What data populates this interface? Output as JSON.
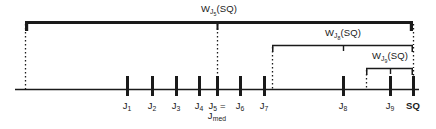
{
  "figure": {
    "background_color": "#ffffff",
    "line_color": "#1a1a1a",
    "axis": {
      "name": "number-line-axis",
      "x_start": 15,
      "x_end": 419,
      "y": 89
    },
    "ticks": [
      {
        "id": "J1",
        "label_main": "J",
        "label_sub": "1",
        "x": 127,
        "label_line2": null
      },
      {
        "id": "J2",
        "label_main": "J",
        "label_sub": "2",
        "x": 152,
        "label_line2": null
      },
      {
        "id": "J3",
        "label_main": "J",
        "label_sub": "3",
        "x": 176,
        "label_line2": null
      },
      {
        "id": "J4",
        "label_main": "J",
        "label_sub": "4",
        "x": 199,
        "label_line2": null
      },
      {
        "id": "J5",
        "label_main": "J",
        "label_sub": "5",
        "x": 217,
        "label_suffix": " =",
        "label_line2": "J",
        "label_line2_sub": "med"
      },
      {
        "id": "J6",
        "label_main": "J",
        "label_sub": "6",
        "x": 240,
        "label_line2": null
      },
      {
        "id": "J7",
        "label_main": "J",
        "label_sub": "7",
        "x": 264,
        "label_line2": null
      },
      {
        "id": "J8",
        "label_main": "J",
        "label_sub": "8",
        "x": 343,
        "label_line2": null
      },
      {
        "id": "J9",
        "label_main": "J",
        "label_sub": "9",
        "x": 390,
        "label_line2": null
      },
      {
        "id": "SQ",
        "label_main": "SQ",
        "label_sub": null,
        "x": 413,
        "label_line2": null,
        "bold": true
      }
    ],
    "brackets": [
      {
        "id": "bracket-J5",
        "label_main": "W",
        "label_sub": "J",
        "label_sub_sub": "5",
        "label_tail": "(SQ)",
        "label_text": "W_J5(SQ)",
        "x_left": 25,
        "x_right": 413,
        "y": 22,
        "tick_x": 217,
        "label_x": 219,
        "label_y": 4
      },
      {
        "id": "bracket-J8",
        "label_main": "W",
        "label_sub": "J",
        "label_sub_sub": "8",
        "label_tail": "(SQ)",
        "label_text": "W_J8(SQ)",
        "x_left": 272,
        "x_right": 413,
        "y": 45,
        "tick_x": 343,
        "label_x": 343,
        "label_y": 28
      },
      {
        "id": "bracket-J9",
        "label_main": "W",
        "label_sub": "J",
        "label_sub_sub": "9",
        "label_tail": "(SQ)",
        "label_text": "W_J9(SQ)",
        "x_left": 366,
        "x_right": 413,
        "y": 68,
        "tick_x": 390,
        "label_x": 390,
        "label_y": 51
      }
    ],
    "dotted_connectors": [
      {
        "id": "dotted-left-end",
        "x": 25,
        "y_top": 24,
        "y_bottom": 89
      },
      {
        "id": "dotted-J5",
        "x": 217,
        "y_top": 24,
        "y_bottom": 82
      },
      {
        "id": "dotted-bracket-J8-left",
        "x": 272,
        "y_top": 47,
        "y_bottom": 89
      },
      {
        "id": "dotted-bracket-J9-left",
        "x": 366,
        "y_top": 70,
        "y_bottom": 89
      },
      {
        "id": "dotted-right-end-top",
        "x": 413,
        "y_top": 24,
        "y_bottom": 45
      },
      {
        "id": "dotted-right-end-mid",
        "x": 413,
        "y_top": 47,
        "y_bottom": 68
      },
      {
        "id": "dotted-right-end-low",
        "x": 413,
        "y_top": 70,
        "y_bottom": 82
      }
    ]
  }
}
